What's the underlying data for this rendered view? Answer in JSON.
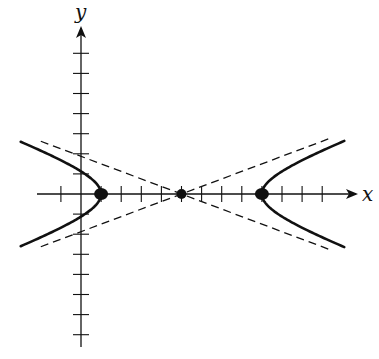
{
  "diagram": {
    "type": "hyperbola",
    "axes": {
      "x_label": "x",
      "y_label": "y",
      "origin_px": [
        81,
        194
      ],
      "unit_px": 20.1,
      "x_tick_units": [
        -1,
        1,
        2,
        3,
        4,
        5,
        6,
        7,
        8,
        9,
        10,
        11,
        12
      ],
      "y_tick_units": [
        -7,
        -6,
        -5,
        -4,
        -3,
        -2,
        -1,
        1,
        2,
        3,
        4,
        5,
        6,
        7
      ],
      "x_range_px": [
        37,
        356
      ],
      "y_range_px": [
        28,
        347
      ]
    },
    "hyperbola": {
      "center": [
        5,
        0
      ],
      "a": 4,
      "b": 1.5,
      "orientation": "horizontal",
      "x_extent_units": [
        -3,
        13.1
      ]
    },
    "points": [
      {
        "name": "center",
        "x": 5,
        "y": 0
      },
      {
        "name": "left-vertex",
        "x": 1,
        "y": 0
      },
      {
        "name": "right-vertex",
        "x": 9,
        "y": 0
      }
    ],
    "asymptotes": {
      "style": "dashed",
      "x_extent_units": [
        -2,
        12.3
      ]
    },
    "colors": {
      "stroke": "#111111",
      "background": "#ffffff"
    }
  }
}
